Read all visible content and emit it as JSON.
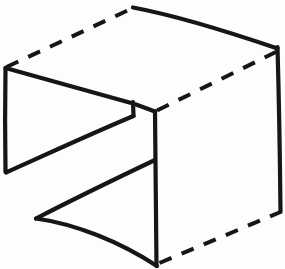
{
  "figure": {
    "canvas": {
      "width": 285,
      "height": 269
    },
    "colors": {
      "background": "#fdfdfd",
      "ink": "#161616"
    },
    "stroke": {
      "solid_width": 4.2,
      "dashed_width": 4.0,
      "dash_pattern": "13 11"
    },
    "edges": [
      {
        "name": "top-back-dashed-edge",
        "style": "dashed",
        "path": "M 6.5 67 L 133 8"
      },
      {
        "name": "top-front-ridge-edge",
        "style": "solid",
        "path": "M 133 7.5 C 178 16, 232 33, 277.5 48.5"
      },
      {
        "name": "top-right-dashed-edge",
        "style": "dashed",
        "path": "M 157 110.5 L 277 51.5"
      },
      {
        "name": "right-vertical-edge",
        "style": "solid",
        "path": "M 277.5 47 C 279 100, 280 160, 280.5 212"
      },
      {
        "name": "bottom-right-dashed-edge",
        "style": "dashed",
        "path": "M 159.5 263 L 280.5 212"
      },
      {
        "name": "center-vertical-edge",
        "style": "solid",
        "path": "M 155 111 C 155.5 160, 156 215, 156.5 266"
      },
      {
        "name": "left-vertical-edge",
        "style": "solid",
        "path": "M 5.5 68 C 5 100, 5 140, 5.5 172"
      },
      {
        "name": "upper-wedge-top-edge",
        "style": "solid",
        "path": "M 5.5 68 C 55 82, 100 94, 133 103.5"
      },
      {
        "name": "upper-wedge-notch-edge",
        "style": "solid",
        "path": "M 133 102 L 133.5 116"
      },
      {
        "name": "upper-wedge-bottom-edge",
        "style": "solid",
        "path": "M 133.5 116 C 95 132, 45 155, 6 172.5"
      },
      {
        "name": "upper-wedge-apex-edge",
        "style": "solid",
        "path": "M 136 104.5 L 155 111.5"
      },
      {
        "name": "lower-wedge-top-edge",
        "style": "solid",
        "path": "M 155 160 C 115 179, 72 200, 36 218.5"
      },
      {
        "name": "lower-wedge-bottom-curve-edge",
        "style": "solid",
        "path": "M 36 218.5 C 76 224, 120 242, 157 266"
      }
    ],
    "vertices": [
      {
        "name": "vertex-top-peak",
        "x": 133,
        "y": 8
      },
      {
        "name": "vertex-top-right",
        "x": 277,
        "y": 48
      },
      {
        "name": "vertex-top-left",
        "x": 6,
        "y": 67
      },
      {
        "name": "vertex-center-upper",
        "x": 155,
        "y": 111
      },
      {
        "name": "vertex-notch-upper",
        "x": 133,
        "y": 103
      },
      {
        "name": "vertex-notch-lower",
        "x": 133,
        "y": 116
      },
      {
        "name": "vertex-left-lower",
        "x": 5,
        "y": 172
      },
      {
        "name": "vertex-center-mid",
        "x": 155,
        "y": 160
      },
      {
        "name": "vertex-lower-wedge-apex",
        "x": 36,
        "y": 218
      },
      {
        "name": "vertex-right-lower",
        "x": 280,
        "y": 212
      },
      {
        "name": "vertex-center-bottom",
        "x": 156,
        "y": 266
      }
    ]
  }
}
